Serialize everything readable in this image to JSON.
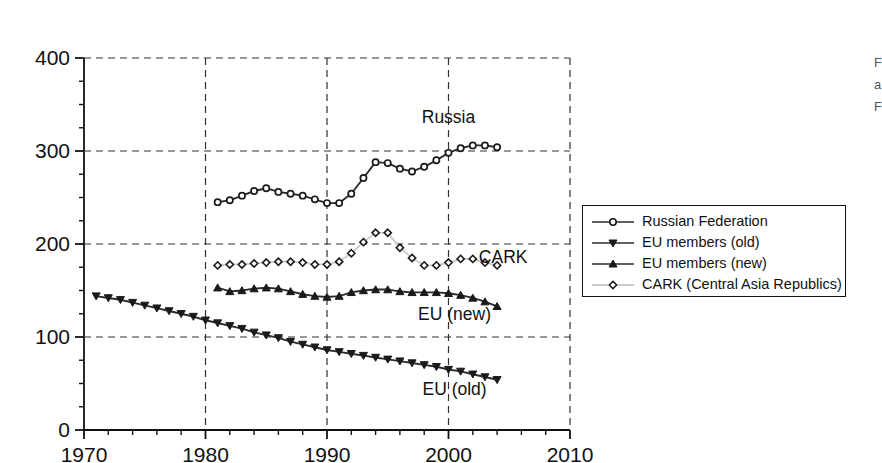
{
  "chart_data": {
    "type": "line",
    "title": "",
    "subtitle": "",
    "xlabel": "",
    "ylabel": "",
    "xlim": [
      1970,
      2010
    ],
    "ylim": [
      0,
      400
    ],
    "x_ticks": [
      "1970",
      "1980",
      "1990",
      "2000",
      "2010"
    ],
    "x_tick_values": [
      1970,
      1980,
      1990,
      2000,
      2010
    ],
    "x_minor_tick_interval": 2,
    "y_ticks": [
      "0",
      "100",
      "200",
      "300",
      "400"
    ],
    "y_tick_values": [
      0,
      100,
      200,
      300,
      400
    ],
    "y_minor_tick_interval": 25,
    "grid": "dashed vertical at decades, dashed horizontal at hundreds",
    "legend_position": "right, outside plot area, boxed",
    "annotations": [
      {
        "text": "Russia",
        "x": 2000.0,
        "y": 330
      },
      {
        "text": "CARK",
        "x": 2004.5,
        "y": 180
      },
      {
        "text": "EU (new)",
        "x": 2000.5,
        "y": 118
      },
      {
        "text": "EU (old)",
        "x": 2000.5,
        "y": 38
      }
    ],
    "series": [
      {
        "name": "Russian Federation",
        "marker": "circle-open",
        "x": [
          1981,
          1982,
          1983,
          1984,
          1985,
          1986,
          1987,
          1988,
          1989,
          1990,
          1991,
          1992,
          1993,
          1994,
          1995,
          1996,
          1997,
          1998,
          1999,
          2000,
          2001,
          2002,
          2003,
          2004
        ],
        "values": [
          245,
          247,
          252,
          257,
          260,
          256,
          254,
          252,
          248,
          244,
          244,
          254,
          271,
          288,
          287,
          281,
          278,
          283,
          290,
          298,
          303,
          306,
          306,
          304
        ]
      },
      {
        "name": "EU members (old)",
        "marker": "triangle-down-filled",
        "x": [
          1971,
          1972,
          1973,
          1974,
          1975,
          1976,
          1977,
          1978,
          1979,
          1980,
          1981,
          1982,
          1983,
          1984,
          1985,
          1986,
          1987,
          1988,
          1989,
          1990,
          1991,
          1992,
          1993,
          1994,
          1995,
          1996,
          1997,
          1998,
          1999,
          2000,
          2001,
          2002,
          2003,
          2004
        ],
        "values": [
          144,
          142,
          140,
          137,
          134,
          131,
          128,
          125,
          122,
          118,
          115,
          112,
          109,
          105,
          102,
          99,
          95,
          92,
          89,
          86,
          84,
          82,
          80,
          78,
          76,
          74,
          72,
          70,
          68,
          65,
          63,
          60,
          57,
          54
        ]
      },
      {
        "name": "EU members (new)",
        "marker": "triangle-up-filled",
        "x": [
          1981,
          1982,
          1983,
          1984,
          1985,
          1986,
          1987,
          1988,
          1989,
          1990,
          1991,
          1992,
          1993,
          1994,
          1995,
          1996,
          1997,
          1998,
          1999,
          2000,
          2001,
          2002,
          2003,
          2004
        ],
        "values": [
          153,
          149,
          150,
          152,
          153,
          152,
          149,
          146,
          144,
          143,
          144,
          148,
          150,
          151,
          151,
          149,
          148,
          148,
          148,
          147,
          145,
          142,
          138,
          133
        ]
      },
      {
        "name": "CARK (Central Asia Republics)",
        "marker": "diamond-open",
        "x": [
          1981,
          1982,
          1983,
          1984,
          1985,
          1986,
          1987,
          1988,
          1989,
          1990,
          1991,
          1992,
          1993,
          1994,
          1995,
          1996,
          1997,
          1998,
          1999,
          2000,
          2001,
          2002,
          2003,
          2004
        ],
        "values": [
          177,
          178,
          178,
          179,
          180,
          181,
          181,
          180,
          178,
          178,
          181,
          190,
          202,
          212,
          212,
          196,
          185,
          177,
          177,
          180,
          184,
          184,
          180,
          177
        ]
      }
    ]
  },
  "legend": {
    "items": [
      {
        "label": "Russian Federation",
        "marker": "circle-open"
      },
      {
        "label": "EU members (old)",
        "marker": "triangle-down-filled"
      },
      {
        "label": "EU members (new)",
        "marker": "triangle-up-filled"
      },
      {
        "label": "CARK (Central Asia Republics)",
        "marker": "diamond-open"
      }
    ]
  },
  "edge_fragment": {
    "line1": "F",
    "line2": "a",
    "line3": "F"
  },
  "colors": {
    "line": "#2b2b2b",
    "grid": "#333333",
    "axis": "#111111",
    "background": "#ffffff"
  }
}
